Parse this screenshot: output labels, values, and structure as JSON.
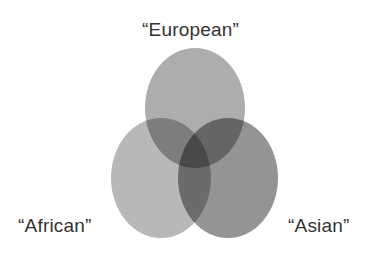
{
  "diagram": {
    "type": "venn",
    "sets": [
      {
        "id": "european",
        "label": "“European”",
        "fill": "#adadad",
        "position": "top"
      },
      {
        "id": "african",
        "label": "“African”",
        "fill": "#b8b8b8",
        "position": "bottom-left"
      },
      {
        "id": "asian",
        "label": "“Asian”",
        "fill": "#949494",
        "position": "bottom-right"
      }
    ],
    "overlap_style": "multiply"
  },
  "labels": {
    "european": "“European”",
    "african": "“African”",
    "asian": "“Asian”"
  },
  "colors": {
    "background": "#ffffff",
    "text": "#333333",
    "european": "#adadad",
    "african": "#b8b8b8",
    "asian": "#949494"
  }
}
